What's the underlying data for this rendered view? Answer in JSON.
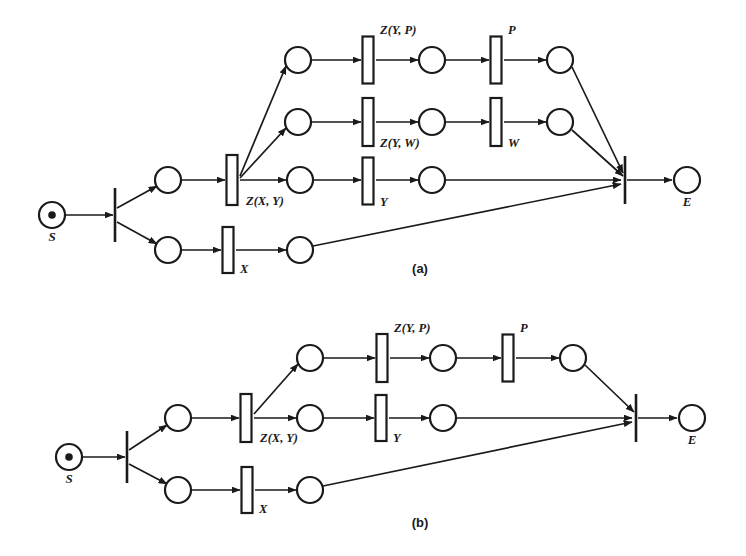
{
  "figure": {
    "background_color": "#ffffff",
    "ink_color": "#1a1a1a",
    "width": 746,
    "height": 556,
    "panels": [
      {
        "id": "a",
        "caption": "(a)",
        "caption_x": 420,
        "caption_y": 273,
        "start_label": "S",
        "end_label": "E",
        "transition_labels": [
          "Z(X, Y)",
          "Z(Y, P)",
          "P",
          "Z(Y, W)",
          "W",
          "Y",
          "X"
        ]
      },
      {
        "id": "b",
        "caption": "(b)",
        "caption_x": 420,
        "caption_y": 527,
        "start_label": "S",
        "end_label": "E",
        "transition_labels": [
          "Z(X, Y)",
          "Z(Y, P)",
          "P",
          "Y",
          "X"
        ]
      }
    ]
  },
  "chart_data": {
    "type": "diagram",
    "subtype": "petri-net",
    "title": "",
    "panels": [
      {
        "id": "a",
        "caption": "(a)",
        "places": [
          {
            "name": "S",
            "label": "S",
            "x": 52,
            "y": 215,
            "r": 13,
            "token": true,
            "label_dx": 0,
            "label_dy": 26
          },
          {
            "name": "p-a-top-branch",
            "label": "",
            "x": 168,
            "y": 180,
            "r": 13,
            "token": false
          },
          {
            "name": "p-a-bottom-branch",
            "label": "",
            "x": 168,
            "y": 250,
            "r": 13,
            "token": false
          },
          {
            "name": "p-a-r1-in",
            "label": "",
            "x": 298,
            "y": 60,
            "r": 13,
            "token": false
          },
          {
            "name": "p-a-r1-mid",
            "label": "",
            "x": 432,
            "y": 60,
            "r": 13,
            "token": false
          },
          {
            "name": "p-a-r1-out",
            "label": "",
            "x": 560,
            "y": 60,
            "r": 13,
            "token": false
          },
          {
            "name": "p-a-r2-in",
            "label": "",
            "x": 298,
            "y": 122,
            "r": 13,
            "token": false
          },
          {
            "name": "p-a-r2-mid",
            "label": "",
            "x": 432,
            "y": 122,
            "r": 13,
            "token": false
          },
          {
            "name": "p-a-r2-out",
            "label": "",
            "x": 560,
            "y": 122,
            "r": 13,
            "token": false
          },
          {
            "name": "p-a-r3-mid",
            "label": "",
            "x": 300,
            "y": 180,
            "r": 13,
            "token": false
          },
          {
            "name": "p-a-r3-out",
            "label": "",
            "x": 432,
            "y": 180,
            "r": 13,
            "token": false
          },
          {
            "name": "p-a-r4-out",
            "label": "",
            "x": 300,
            "y": 250,
            "r": 13,
            "token": false
          },
          {
            "name": "E",
            "label": "E",
            "x": 687,
            "y": 180,
            "r": 13,
            "token": false,
            "label_dx": 0,
            "label_dy": 26
          }
        ],
        "transitions": [
          {
            "name": "t-a-split",
            "style": "bar",
            "label": "",
            "x": 115,
            "y": 215,
            "h": 54
          },
          {
            "name": "t-a-zxy",
            "style": "box",
            "label": "Z(X, Y)",
            "x": 232,
            "y": 180,
            "w": 11,
            "h": 50,
            "label_dx": 14,
            "label_dy": 25,
            "anchor": "start"
          },
          {
            "name": "t-a-zyp",
            "style": "box",
            "label": "Z(Y, P)",
            "x": 368,
            "y": 60,
            "w": 11,
            "h": 47,
            "label_dx": 12,
            "label_dy": -26,
            "anchor": "start"
          },
          {
            "name": "t-a-p",
            "style": "box",
            "label": "P",
            "x": 496,
            "y": 60,
            "w": 11,
            "h": 47,
            "label_dx": 12,
            "label_dy": -26,
            "anchor": "start"
          },
          {
            "name": "t-a-zyw",
            "style": "box",
            "label": "Z(Y, W)",
            "x": 368,
            "y": 122,
            "w": 11,
            "h": 48,
            "label_dx": 12,
            "label_dy": 25,
            "anchor": "start"
          },
          {
            "name": "t-a-w",
            "style": "box",
            "label": "W",
            "x": 496,
            "y": 122,
            "w": 11,
            "h": 48,
            "label_dx": 12,
            "label_dy": 25,
            "anchor": "start"
          },
          {
            "name": "t-a-y",
            "style": "box",
            "label": "Y",
            "x": 368,
            "y": 181,
            "w": 11,
            "h": 47,
            "label_dx": 12,
            "label_dy": 25,
            "anchor": "start"
          },
          {
            "name": "t-a-x",
            "style": "box",
            "label": "X",
            "x": 228,
            "y": 250,
            "w": 11,
            "h": 46,
            "label_dx": 12,
            "label_dy": 23,
            "anchor": "start"
          },
          {
            "name": "t-a-join",
            "style": "bar",
            "label": "",
            "x": 625,
            "y": 180,
            "h": 48
          }
        ],
        "arcs": [
          {
            "from": "S",
            "to": "t-a-split",
            "x1": 66,
            "y1": 215,
            "x2": 113,
            "y2": 215
          },
          {
            "from": "t-a-split",
            "to": "p-a-top-branch",
            "x1": 117,
            "y1": 208,
            "x2": 157,
            "y2": 186
          },
          {
            "from": "t-a-split",
            "to": "p-a-bottom-branch",
            "x1": 117,
            "y1": 222,
            "x2": 157,
            "y2": 244
          },
          {
            "from": "p-a-top-branch",
            "to": "t-a-zxy",
            "x1": 182,
            "y1": 180,
            "x2": 225,
            "y2": 180
          },
          {
            "from": "t-a-zxy",
            "to": "p-a-r1-in",
            "x1": 240,
            "y1": 176,
            "x2": 286,
            "y2": 66
          },
          {
            "from": "t-a-zxy",
            "to": "p-a-r2-in",
            "x1": 240,
            "y1": 178,
            "x2": 286,
            "y2": 128
          },
          {
            "from": "t-a-zxy",
            "to": "p-a-r3-mid",
            "x1": 240,
            "y1": 180,
            "x2": 286,
            "y2": 180
          },
          {
            "from": "p-a-r1-in",
            "to": "t-a-zyp",
            "x1": 312,
            "y1": 60,
            "x2": 361,
            "y2": 60
          },
          {
            "from": "t-a-zyp",
            "to": "p-a-r1-mid",
            "x1": 376,
            "y1": 60,
            "x2": 418,
            "y2": 60
          },
          {
            "from": "p-a-r1-mid",
            "to": "t-a-p",
            "x1": 446,
            "y1": 60,
            "x2": 489,
            "y2": 60
          },
          {
            "from": "t-a-p",
            "to": "p-a-r1-out",
            "x1": 504,
            "y1": 60,
            "x2": 546,
            "y2": 60
          },
          {
            "from": "p-a-r2-in",
            "to": "t-a-zyw",
            "x1": 312,
            "y1": 122,
            "x2": 361,
            "y2": 122
          },
          {
            "from": "t-a-zyw",
            "to": "p-a-r2-mid",
            "x1": 376,
            "y1": 122,
            "x2": 418,
            "y2": 122
          },
          {
            "from": "p-a-r2-mid",
            "to": "t-a-w",
            "x1": 446,
            "y1": 122,
            "x2": 489,
            "y2": 122
          },
          {
            "from": "t-a-w",
            "to": "p-a-r2-out",
            "x1": 504,
            "y1": 122,
            "x2": 546,
            "y2": 122
          },
          {
            "from": "p-a-r3-mid",
            "to": "t-a-y",
            "x1": 314,
            "y1": 180,
            "x2": 361,
            "y2": 180
          },
          {
            "from": "t-a-y",
            "to": "p-a-r3-out",
            "x1": 376,
            "y1": 180,
            "x2": 418,
            "y2": 180
          },
          {
            "from": "p-a-bottom-branch",
            "to": "t-a-x",
            "x1": 182,
            "y1": 250,
            "x2": 221,
            "y2": 250
          },
          {
            "from": "t-a-x",
            "to": "p-a-r4-out",
            "x1": 236,
            "y1": 250,
            "x2": 286,
            "y2": 250
          },
          {
            "from": "p-a-r1-out",
            "to": "t-a-join",
            "x1": 572,
            "y1": 67,
            "x2": 623,
            "y2": 173
          },
          {
            "from": "p-a-r2-out",
            "to": "t-a-join",
            "x1": 572,
            "y1": 130,
            "x2": 623,
            "y2": 176
          },
          {
            "from": "p-a-r3-out",
            "to": "t-a-join",
            "x1": 446,
            "y1": 180,
            "x2": 621,
            "y2": 180
          },
          {
            "from": "p-a-r4-out",
            "to": "t-a-join",
            "x1": 313,
            "y1": 246,
            "x2": 621,
            "y2": 184
          },
          {
            "from": "t-a-join",
            "to": "E",
            "x1": 627,
            "y1": 180,
            "x2": 672,
            "y2": 180
          }
        ]
      },
      {
        "id": "b",
        "caption": "(b)",
        "places": [
          {
            "name": "S",
            "label": "S",
            "x": 69,
            "y": 457,
            "r": 13,
            "token": true,
            "label_dx": 0,
            "label_dy": 26
          },
          {
            "name": "p-b-top-branch",
            "label": "",
            "x": 178,
            "y": 418,
            "r": 13,
            "token": false
          },
          {
            "name": "p-b-bottom-branch",
            "label": "",
            "x": 178,
            "y": 490,
            "r": 13,
            "token": false
          },
          {
            "name": "p-b-r1-in",
            "label": "",
            "x": 310,
            "y": 358,
            "r": 13,
            "token": false
          },
          {
            "name": "p-b-r1-mid",
            "label": "",
            "x": 443,
            "y": 358,
            "r": 13,
            "token": false
          },
          {
            "name": "p-b-r1-out",
            "label": "",
            "x": 573,
            "y": 358,
            "r": 13,
            "token": false
          },
          {
            "name": "p-b-r2-mid",
            "label": "",
            "x": 310,
            "y": 418,
            "r": 13,
            "token": false
          },
          {
            "name": "p-b-r2-out",
            "label": "",
            "x": 443,
            "y": 418,
            "r": 13,
            "token": false
          },
          {
            "name": "p-b-r3-out",
            "label": "",
            "x": 310,
            "y": 490,
            "r": 13,
            "token": false
          },
          {
            "name": "E",
            "label": "E",
            "x": 692,
            "y": 418,
            "r": 13,
            "token": false,
            "label_dx": 0,
            "label_dy": 26
          }
        ],
        "transitions": [
          {
            "name": "t-b-split",
            "style": "bar",
            "label": "",
            "x": 127,
            "y": 457,
            "h": 52
          },
          {
            "name": "t-b-zxy",
            "style": "box",
            "label": "Z(X, Y)",
            "x": 246,
            "y": 418,
            "w": 11,
            "h": 48,
            "label_dx": 14,
            "label_dy": 24,
            "anchor": "start"
          },
          {
            "name": "t-b-zyp",
            "style": "box",
            "label": "Z(Y, P)",
            "x": 382,
            "y": 358,
            "w": 11,
            "h": 48,
            "label_dx": 12,
            "label_dy": -26,
            "anchor": "start"
          },
          {
            "name": "t-b-p",
            "style": "box",
            "label": "P",
            "x": 508,
            "y": 358,
            "w": 11,
            "h": 47,
            "label_dx": 12,
            "label_dy": -26,
            "anchor": "start"
          },
          {
            "name": "t-b-y",
            "style": "box",
            "label": "Y",
            "x": 381,
            "y": 418,
            "w": 11,
            "h": 46,
            "label_dx": 12,
            "label_dy": 24,
            "anchor": "start"
          },
          {
            "name": "t-b-x",
            "style": "box",
            "label": "X",
            "x": 247,
            "y": 490,
            "w": 11,
            "h": 46,
            "label_dx": 12,
            "label_dy": 23,
            "anchor": "start"
          },
          {
            "name": "t-b-join",
            "style": "bar",
            "label": "",
            "x": 636,
            "y": 418,
            "h": 48
          }
        ],
        "arcs": [
          {
            "from": "S",
            "to": "t-b-split",
            "x1": 83,
            "y1": 457,
            "x2": 125,
            "y2": 457
          },
          {
            "from": "t-b-split",
            "to": "p-b-top-branch",
            "x1": 129,
            "y1": 450,
            "x2": 167,
            "y2": 425
          },
          {
            "from": "t-b-split",
            "to": "p-b-bottom-branch",
            "x1": 129,
            "y1": 464,
            "x2": 167,
            "y2": 484
          },
          {
            "from": "p-b-top-branch",
            "to": "t-b-zxy",
            "x1": 192,
            "y1": 418,
            "x2": 239,
            "y2": 418
          },
          {
            "from": "t-b-zxy",
            "to": "p-b-r1-in",
            "x1": 254,
            "y1": 414,
            "x2": 298,
            "y2": 364
          },
          {
            "from": "t-b-zxy",
            "to": "p-b-r2-mid",
            "x1": 254,
            "y1": 418,
            "x2": 296,
            "y2": 418
          },
          {
            "from": "p-b-r1-in",
            "to": "t-b-zyp",
            "x1": 324,
            "y1": 358,
            "x2": 375,
            "y2": 358
          },
          {
            "from": "t-b-zyp",
            "to": "p-b-r1-mid",
            "x1": 390,
            "y1": 358,
            "x2": 429,
            "y2": 358
          },
          {
            "from": "p-b-r1-mid",
            "to": "t-b-p",
            "x1": 457,
            "y1": 358,
            "x2": 501,
            "y2": 358
          },
          {
            "from": "t-b-p",
            "to": "p-b-r1-out",
            "x1": 516,
            "y1": 358,
            "x2": 559,
            "y2": 358
          },
          {
            "from": "p-b-r2-mid",
            "to": "t-b-y",
            "x1": 324,
            "y1": 418,
            "x2": 374,
            "y2": 418
          },
          {
            "from": "t-b-y",
            "to": "p-b-r2-out",
            "x1": 389,
            "y1": 418,
            "x2": 429,
            "y2": 418
          },
          {
            "from": "p-b-bottom-branch",
            "to": "t-b-x",
            "x1": 192,
            "y1": 490,
            "x2": 240,
            "y2": 490
          },
          {
            "from": "t-b-x",
            "to": "p-b-r3-out",
            "x1": 255,
            "y1": 490,
            "x2": 296,
            "y2": 490
          },
          {
            "from": "p-b-r1-out",
            "to": "t-b-join",
            "x1": 585,
            "y1": 365,
            "x2": 634,
            "y2": 412
          },
          {
            "from": "p-b-r2-out",
            "to": "t-b-join",
            "x1": 457,
            "y1": 418,
            "x2": 632,
            "y2": 418
          },
          {
            "from": "p-b-r3-out",
            "to": "t-b-join",
            "x1": 323,
            "y1": 486,
            "x2": 632,
            "y2": 422
          },
          {
            "from": "t-b-join",
            "to": "E",
            "x1": 638,
            "y1": 418,
            "x2": 677,
            "y2": 418
          }
        ]
      }
    ]
  }
}
